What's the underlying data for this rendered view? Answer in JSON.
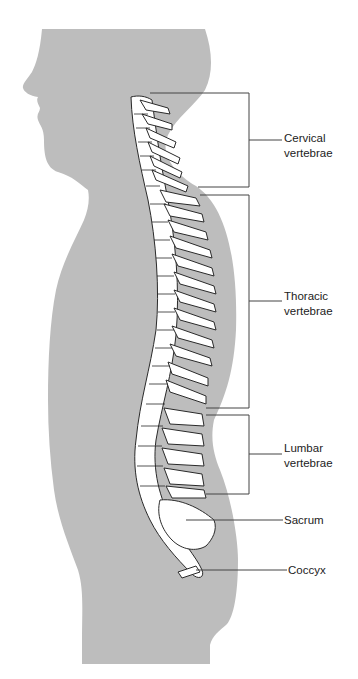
{
  "diagram": {
    "colors": {
      "silhouette": "#bdbdbd",
      "bone_fill": "#ffffff",
      "bone_outline": "#2a2a2a",
      "leader_line": "#444444",
      "background": "#ffffff"
    },
    "labels": [
      {
        "id": "cervical",
        "line1": "Cervical",
        "line2": "vertebrae"
      },
      {
        "id": "thoracic",
        "line1": "Thoracic",
        "line2": "vertebrae"
      },
      {
        "id": "lumbar",
        "line1": "Lumbar",
        "line2": "vertebrae"
      },
      {
        "id": "sacrum",
        "line1": "Sacrum"
      },
      {
        "id": "coccyx",
        "line1": "Coccyx"
      }
    ]
  }
}
